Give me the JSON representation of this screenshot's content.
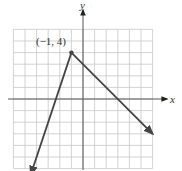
{
  "chart_data": {
    "type": "line",
    "title": "",
    "xlabel": "x",
    "ylabel": "y",
    "xlim": [
      -6,
      6
    ],
    "ylim": [
      -6,
      6
    ],
    "grid": true,
    "grid_step": 1,
    "series": [
      {
        "name": "piecewise-linear graph",
        "points": [
          [
            -4.5,
            -6.5
          ],
          [
            -1,
            4
          ],
          [
            6,
            -3
          ]
        ],
        "left_slope": 3,
        "right_slope": -1,
        "arrows": "both ends",
        "color": "#444444"
      }
    ],
    "annotations": [
      {
        "text": "(−1, 4)",
        "x": -1,
        "y": 4,
        "marker": "dot"
      }
    ]
  },
  "labels": {
    "x_axis": "x",
    "y_axis": "y",
    "vertex": "(−1, 4)"
  },
  "colors": {
    "grid": "#c8c8c8",
    "axis": "#555555",
    "line": "#444444"
  }
}
